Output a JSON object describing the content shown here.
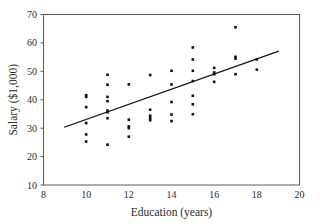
{
  "chart_data": {
    "type": "scatter",
    "title": "",
    "xlabel": "Education (years)",
    "ylabel": "Salary ($1,000)",
    "xlim": [
      8,
      20
    ],
    "ylim": [
      10,
      70
    ],
    "xticks": [
      8,
      10,
      12,
      14,
      16,
      18,
      20
    ],
    "yticks": [
      10,
      20,
      30,
      40,
      50,
      60,
      70
    ],
    "grid": false,
    "legend": null,
    "point_color": "#111111",
    "line_color": "#111111",
    "frame_color": "#5a5a5a",
    "background": "#ffffff",
    "series": [
      {
        "name": "Observations",
        "marker": "square",
        "points": [
          {
            "x": 10,
            "y": 41.6
          },
          {
            "x": 10,
            "y": 41.0
          },
          {
            "x": 10,
            "y": 37.4
          },
          {
            "x": 10,
            "y": 31.8
          },
          {
            "x": 10,
            "y": 27.8
          },
          {
            "x": 10,
            "y": 25.3
          },
          {
            "x": 11,
            "y": 48.8
          },
          {
            "x": 11,
            "y": 45.3
          },
          {
            "x": 11,
            "y": 41.0
          },
          {
            "x": 11,
            "y": 39.5
          },
          {
            "x": 11,
            "y": 36.2
          },
          {
            "x": 11,
            "y": 35.6
          },
          {
            "x": 11,
            "y": 33.5
          },
          {
            "x": 11,
            "y": 24.2
          },
          {
            "x": 12,
            "y": 45.4
          },
          {
            "x": 12,
            "y": 33.0
          },
          {
            "x": 12,
            "y": 30.6
          },
          {
            "x": 12,
            "y": 30.0
          },
          {
            "x": 12,
            "y": 27.0
          },
          {
            "x": 13,
            "y": 48.7
          },
          {
            "x": 13,
            "y": 36.5
          },
          {
            "x": 13,
            "y": 34.4
          },
          {
            "x": 13,
            "y": 33.6
          },
          {
            "x": 13,
            "y": 32.8
          },
          {
            "x": 14,
            "y": 50.2
          },
          {
            "x": 14,
            "y": 45.4
          },
          {
            "x": 14,
            "y": 39.2
          },
          {
            "x": 14,
            "y": 34.8
          },
          {
            "x": 14,
            "y": 32.5
          },
          {
            "x": 15,
            "y": 58.4
          },
          {
            "x": 15,
            "y": 54.2
          },
          {
            "x": 15,
            "y": 50.2
          },
          {
            "x": 15,
            "y": 46.6
          },
          {
            "x": 15,
            "y": 41.4
          },
          {
            "x": 15,
            "y": 38.4
          },
          {
            "x": 15,
            "y": 34.9
          },
          {
            "x": 16,
            "y": 51.2
          },
          {
            "x": 16,
            "y": 49.6
          },
          {
            "x": 16,
            "y": 49.0
          },
          {
            "x": 16,
            "y": 46.3
          },
          {
            "x": 17,
            "y": 65.5
          },
          {
            "x": 17,
            "y": 55.1
          },
          {
            "x": 17,
            "y": 54.5
          },
          {
            "x": 17,
            "y": 49.0
          },
          {
            "x": 18,
            "y": 54.2
          },
          {
            "x": 18,
            "y": 50.6
          }
        ]
      }
    ],
    "trendline": {
      "name": "least-squares fit",
      "x_start": 9.0,
      "y_start": 30.4,
      "x_end": 19.0,
      "y_end": 57.0
    }
  }
}
